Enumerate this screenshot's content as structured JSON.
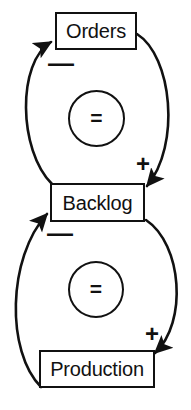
{
  "diagram": {
    "type": "causal-loop-diagram",
    "title": "",
    "nodes": [
      {
        "id": "orders",
        "label": "Orders"
      },
      {
        "id": "backlog",
        "label": "Backlog"
      },
      {
        "id": "production",
        "label": "Production"
      }
    ],
    "loop_markers": [
      {
        "id": "top",
        "label": "=",
        "meaning": "balancing-loop"
      },
      {
        "id": "bottom",
        "label": "=",
        "meaning": "balancing-loop"
      }
    ],
    "links": [
      {
        "id": "orders-to-backlog",
        "from": "Orders",
        "to": "Backlog",
        "polarity": "+"
      },
      {
        "id": "backlog-to-orders",
        "from": "Backlog",
        "to": "Orders",
        "polarity": "—"
      },
      {
        "id": "backlog-to-production",
        "from": "Backlog",
        "to": "Production",
        "polarity": "+"
      },
      {
        "id": "production-to-backlog",
        "from": "Production",
        "to": "Backlog",
        "polarity": "—"
      }
    ],
    "polarity_labels": {
      "orders_minus": "—",
      "backlog_plus": "+",
      "backlog_minus": "—",
      "production_plus": "+"
    },
    "colors": {
      "stroke": "#111111",
      "background": "#ffffff"
    }
  }
}
